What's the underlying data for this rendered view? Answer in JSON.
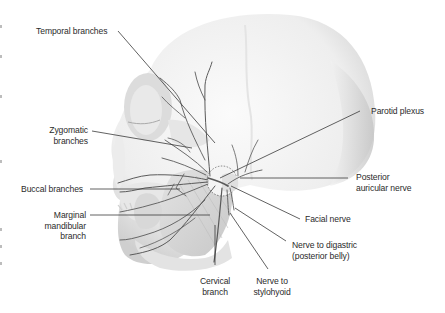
{
  "figure": {
    "colors": {
      "background": "#ffffff",
      "nerve": "#5a5a5a",
      "leader_line": "#3a3a3a",
      "label_text": "#2b2b2b",
      "skull_light": "#f2f2f2",
      "skull_shadow": "#c9c9c9",
      "muscle": "#d6d6d6"
    }
  },
  "labels": {
    "temporal": "Temporal branches",
    "zygomatic_1": "Zygomatic",
    "zygomatic_2": "branches",
    "buccal": "Buccal branches",
    "marginal_1": "Marginal",
    "marginal_2": "mandibular",
    "marginal_3": "branch",
    "cervical_1": "Cervical",
    "cervical_2": "branch",
    "stylohyoid_1": "Nerve to",
    "stylohyoid_2": "stylohyoid",
    "digastric_1": "Nerve to digastric",
    "digastric_2": "(posterior belly)",
    "facial": "Facial nerve",
    "posterior_auricular_1": "Posterior",
    "posterior_auricular_2": "auricular nerve",
    "parotid": "Parotid plexus"
  }
}
